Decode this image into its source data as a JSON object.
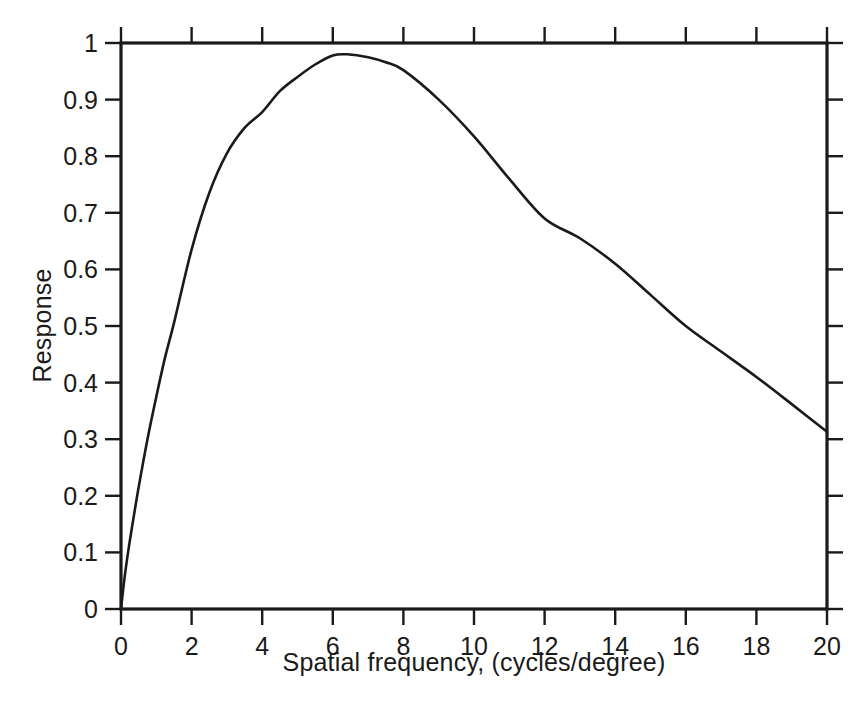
{
  "chart_data": {
    "type": "line",
    "title": "",
    "subtitle": "",
    "xlabel": "Spatial frequency, (cycles/degree)",
    "ylabel": "Response",
    "xlim": [
      0,
      20
    ],
    "ylim": [
      0,
      1
    ],
    "grid": false,
    "legend": null,
    "annotations": [],
    "xticks": [
      0,
      2,
      4,
      6,
      8,
      10,
      12,
      14,
      16,
      18,
      20
    ],
    "xtick_labels": [
      "0",
      "2",
      "4",
      "6",
      "8",
      "10",
      "12",
      "14",
      "16",
      "18",
      "20"
    ],
    "yticks": [
      0,
      0.1,
      0.2,
      0.3,
      0.4,
      0.5,
      0.6,
      0.7,
      0.8,
      0.9,
      1
    ],
    "ytick_labels": [
      "0",
      "0.1",
      "0.2",
      "0.3",
      "0.4",
      "0.5",
      "0.6",
      "0.7",
      "0.8",
      "0.9",
      "1"
    ],
    "line_color": "#1a1a1a",
    "line_width": 2.6,
    "peak": {
      "x": 6.4,
      "y": 0.98
    },
    "x": [
      0,
      0.1,
      0.2,
      0.3,
      0.5,
      0.75,
      1,
      1.25,
      1.5,
      2,
      2.5,
      3,
      3.5,
      4,
      4.5,
      5,
      5.5,
      6,
      6.4,
      7,
      7.5,
      8,
      9,
      10,
      11,
      12,
      13,
      14,
      15,
      16,
      17,
      18,
      19,
      20
    ],
    "y": [
      0,
      0.055,
      0.1,
      0.14,
      0.215,
      0.3,
      0.375,
      0.445,
      0.505,
      0.635,
      0.735,
      0.805,
      0.85,
      0.878,
      0.915,
      0.94,
      0.962,
      0.978,
      0.98,
      0.975,
      0.966,
      0.952,
      0.9,
      0.835,
      0.76,
      0.69,
      0.655,
      0.61,
      0.555,
      0.5,
      0.455,
      0.41,
      0.362,
      0.313
    ]
  },
  "axes": {
    "ylabel": "Response",
    "xlabel": "Spatial frequency, (cycles/degree)"
  }
}
